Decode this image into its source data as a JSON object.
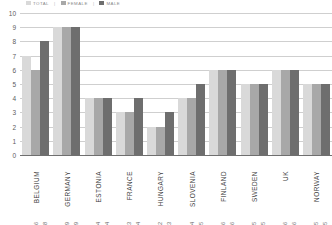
{
  "legend": {
    "items": [
      {
        "label": "TOTAL",
        "color": "#d9d9d9"
      },
      {
        "label": "FEMALE",
        "color": "#a8a8a8"
      },
      {
        "label": "MALE",
        "color": "#6e6e6e"
      }
    ],
    "separator": "|"
  },
  "axis": {
    "y_ticks": [
      "10",
      "9",
      "8",
      "7",
      "6",
      "5",
      "4",
      "3",
      "2",
      "1",
      "0"
    ]
  },
  "chart_data": {
    "type": "bar",
    "title": "",
    "xlabel": "",
    "ylabel": "",
    "ylim": [
      0,
      10
    ],
    "grid": true,
    "legend_position": "top-left",
    "categories": [
      "BELGIUM",
      "GERMANY",
      "ESTONIA",
      "FRANCE",
      "HUNGARY",
      "SLOVENIA",
      "FINLAND",
      "SWEDEN",
      "UK",
      "NORWAY"
    ],
    "series": [
      {
        "name": "TOTAL",
        "color": "#d9d9d9",
        "values": [
          7,
          9,
          4,
          3,
          2,
          4,
          6,
          5,
          6,
          5
        ]
      },
      {
        "name": "FEMALE",
        "color": "#a8a8a8",
        "values": [
          6,
          9,
          4,
          3,
          2,
          4,
          6,
          5,
          6,
          5
        ]
      },
      {
        "name": "MALE",
        "color": "#6e6e6e",
        "values": [
          8,
          9,
          4,
          4,
          3,
          5,
          6,
          5,
          6,
          5
        ]
      }
    ],
    "bar_value_labels": [
      [
        "",
        "6",
        "8"
      ],
      [
        "",
        "9",
        "9"
      ],
      [
        "",
        "4",
        "4"
      ],
      [
        "",
        "3",
        "4"
      ],
      [
        "",
        "2",
        "3"
      ],
      [
        "",
        "4",
        "5"
      ],
      [
        "",
        "6",
        "6"
      ],
      [
        "",
        "5",
        "5"
      ],
      [
        "",
        "6",
        "6"
      ],
      [
        "",
        "5",
        "5"
      ]
    ]
  },
  "colors": {
    "background": "#ffffff",
    "gridline": "#cfcfcf",
    "axis": "#6f6f6f",
    "tick_text": "#5d5d5d",
    "label_text": "#3d3d3d"
  }
}
